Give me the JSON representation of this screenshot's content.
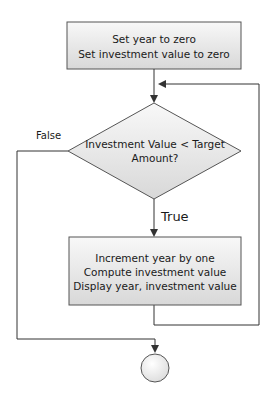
{
  "flowchart": {
    "init_box": {
      "lines": [
        "Set year to zero",
        "Set investment value to zero"
      ]
    },
    "decision": {
      "lines": [
        "Investment Value < Target",
        "Amount?"
      ]
    },
    "true_label": "True",
    "false_label": "False",
    "loop_box": {
      "lines": [
        "Increment year by one",
        "Compute investment value",
        "Display year, investment value"
      ]
    },
    "end_node": "circle"
  },
  "colors": {
    "stroke": "#3a3a3a",
    "fill_top": "#f7f7f7",
    "fill_bottom": "#d9d9d9",
    "text": "#1a1a1a"
  }
}
